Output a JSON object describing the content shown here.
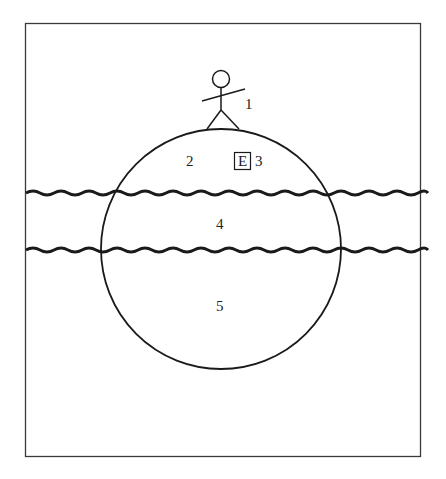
{
  "diagram": {
    "labels": {
      "figure": "1",
      "region_2": "2",
      "region_3": "3",
      "region_4": "4",
      "region_5": "5",
      "box_e": "E"
    },
    "elements": {
      "frame": "rectangular border",
      "sphere": "large circle",
      "wavy_lines": 2,
      "stick_figure": "person standing on top of circle"
    },
    "colors": {
      "stroke": "#1a1a1a",
      "background": "#ffffff"
    }
  }
}
